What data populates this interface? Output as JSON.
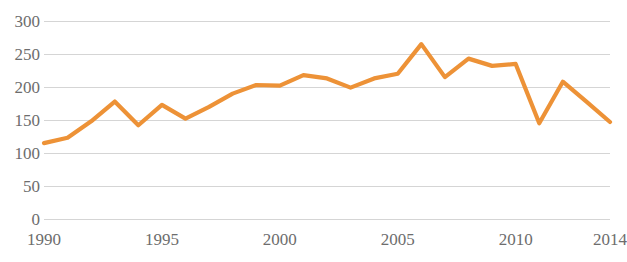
{
  "chart_data": {
    "type": "line",
    "title": "",
    "subtitle": "",
    "xlabel": "",
    "ylabel": "",
    "xlim": [
      1990,
      2014
    ],
    "ylim": [
      0,
      300
    ],
    "grid": "horizontal",
    "legend": "none",
    "y_ticks": [
      300,
      250,
      200,
      150,
      100,
      50,
      0
    ],
    "x_ticks": [
      1990,
      1995,
      2000,
      2005,
      2010,
      2014
    ],
    "x_tick_labels": [
      "1990",
      "1995",
      "2000",
      "2005",
      "2010",
      "2014"
    ],
    "y_tick_labels": [
      "300",
      "250",
      "200",
      "150",
      "100",
      "50",
      "0"
    ],
    "series": [
      {
        "name": "series-1",
        "color": "#ED9237",
        "x": [
          1990,
          1991,
          1992,
          1993,
          1994,
          1995,
          1996,
          1997,
          1998,
          1999,
          2000,
          2001,
          2002,
          2003,
          2004,
          2005,
          2006,
          2007,
          2008,
          2009,
          2010,
          2011,
          2012,
          2013,
          2014
        ],
        "values": [
          115,
          123,
          148,
          178,
          142,
          173,
          152,
          170,
          190,
          203,
          202,
          218,
          213,
          199,
          213,
          220,
          265,
          215,
          243,
          232,
          235,
          145,
          208,
          178,
          147
        ]
      }
    ],
    "colors": {
      "line": "#ED9237",
      "gridline": "#d5d5d5",
      "tick_label": "#6d6d6d",
      "background": "#ffffff"
    },
    "plot_area": {
      "left": 44,
      "right": 610,
      "top": 21,
      "bottom": 219
    }
  }
}
